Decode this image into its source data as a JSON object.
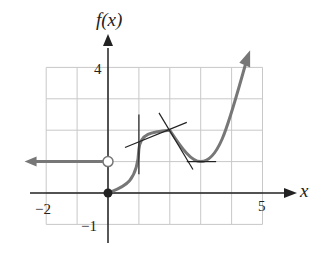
{
  "chart_data": {
    "type": "line",
    "title": "",
    "xlabel": "x",
    "ylabel": "f(x)",
    "xlim": [
      -2,
      5
    ],
    "ylim": [
      -1,
      4
    ],
    "grid": true,
    "x_tick_labels": [
      "-2",
      "5"
    ],
    "y_tick_labels": [
      "4",
      "-1"
    ],
    "colors": {
      "curve": "#777777",
      "tangent": "#222222",
      "grid": "#c8c8c8",
      "axis": "#222222"
    },
    "series": [
      {
        "name": "left ray",
        "description": "constant f(x)=1 for x<0, arrow pointing left, open circle at (0,1)",
        "points": [
          [
            -2.7,
            1
          ],
          [
            0,
            1
          ]
        ],
        "endpoint": {
          "x": 0,
          "y": 1,
          "type": "open"
        }
      },
      {
        "name": "curve",
        "description": "f(x) for x>=0: starts at filled point (0,0), vertical tangent at x=1, corner at (2,2), local minimum at (3,1), increases with arrow",
        "points": [
          [
            0,
            0
          ],
          [
            0.5,
            0.25
          ],
          [
            0.9,
            0.7
          ],
          [
            1,
            1.5
          ],
          [
            1.1,
            1.75
          ],
          [
            1.5,
            1.9
          ],
          [
            2,
            2
          ],
          [
            2.5,
            1.35
          ],
          [
            3,
            1
          ],
          [
            3.5,
            1.5
          ],
          [
            4,
            2.8
          ],
          [
            4.6,
            4.5
          ]
        ],
        "start": {
          "x": 0,
          "y": 0,
          "type": "filled"
        }
      }
    ],
    "tangent_lines": [
      {
        "name": "vertical tangent at x=1",
        "from": [
          1,
          0.6
        ],
        "to": [
          1,
          2.5
        ]
      },
      {
        "name": "tangent at (2,2) shallow",
        "from": [
          0.55,
          1.45
        ],
        "to": [
          2.55,
          2.25
        ]
      },
      {
        "name": "tangent at (2,2) steep",
        "from": [
          1.65,
          2.55
        ],
        "to": [
          2.75,
          0.75
        ]
      },
      {
        "name": "horizontal tangent at (3,1)",
        "from": [
          2.55,
          1
        ],
        "to": [
          3.5,
          1
        ]
      }
    ],
    "annotations": []
  }
}
